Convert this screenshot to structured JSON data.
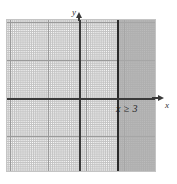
{
  "figure": {
    "kind": "coordinate-plane-inequality-graph",
    "background_color": "#ffffff"
  },
  "axes": {
    "x_axis_label": "x",
    "y_axis_label": "y",
    "axis_color": "#3a3a3a",
    "origin_px": {
      "x": 80,
      "y": 99
    },
    "minor_grid_spacing_px": 7.6,
    "major_grid_every_n_minor": 5,
    "grid_minor_color": "#b9b9b9",
    "grid_major_color": "#9a9a9a",
    "xlim": [
      -9.7,
      10.0
    ],
    "ylim": [
      -9.6,
      10.4
    ]
  },
  "inequality": {
    "label": "x ≥ 3",
    "boundary_value": 3,
    "boundary_style": "solid",
    "boundary_color": "#2b2b2b",
    "shaded_side": "right",
    "shade_color": "#a9a9a9"
  },
  "chart_data": {
    "type": "area",
    "title": "",
    "xlabel": "x",
    "ylabel": "y",
    "grid": true,
    "legend": "none",
    "xlim": [
      -9.7,
      10.0
    ],
    "ylim": [
      -9.6,
      10.4
    ],
    "annotations": [
      {
        "text": "x ≥ 3",
        "x": 4.7,
        "y": -0.7
      }
    ],
    "series": [
      {
        "name": "x ≥ 3",
        "type": "vertical-boundary-line",
        "x": 3,
        "line_style": "solid",
        "inclusive": true
      },
      {
        "name": "solution region",
        "type": "shaded-half-plane",
        "x_from": 3,
        "x_to": 10.0,
        "y_from": -9.6,
        "y_to": 10.4,
        "fill": "#a9a9a9"
      }
    ]
  }
}
